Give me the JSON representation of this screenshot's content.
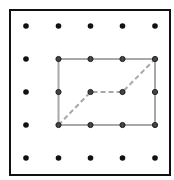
{
  "diagram": {
    "type": "geoboard",
    "grid": {
      "rows": 5,
      "cols": 5,
      "x": [
        26,
        58.5,
        90.5,
        122.5,
        155
      ],
      "y": [
        26,
        59,
        92,
        125,
        158
      ]
    },
    "frame": {
      "x": 10,
      "y": 10,
      "width": 160,
      "height": 165,
      "stroke": "#111111"
    },
    "rectangle": {
      "from": [
        1,
        1
      ],
      "to": [
        4,
        3
      ],
      "stroke": "#a8a8a8"
    },
    "dashed_path": {
      "points": [
        [
          1,
          3
        ],
        [
          2,
          2
        ],
        [
          3,
          2
        ],
        [
          4,
          1
        ]
      ],
      "stroke": "#a8a8a8"
    },
    "colors": {
      "dot": "#111111",
      "line": "#a8a8a8",
      "background": "#ffffff"
    }
  }
}
